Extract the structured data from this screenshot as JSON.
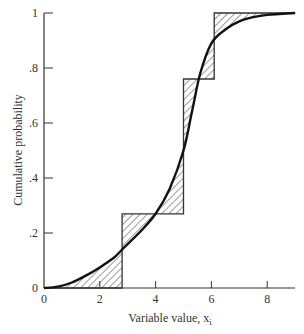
{
  "chart_data": {
    "type": "line",
    "title": "",
    "xlabel": "Variable value, x",
    "xlabel_subscript": "i",
    "ylabel": "Cumulative probability",
    "xlim": [
      0,
      9
    ],
    "ylim": [
      0,
      1
    ],
    "grid": false,
    "x_ticks": [
      0,
      2,
      4,
      6,
      8
    ],
    "x_tick_labels": [
      "0",
      "2",
      "4",
      "6",
      "8"
    ],
    "y_ticks": [
      0,
      0.2,
      0.4,
      0.6,
      0.8,
      1
    ],
    "y_tick_labels": [
      "0",
      ".2",
      ".4",
      ".6",
      ".8",
      "1"
    ],
    "series": [
      {
        "name": "Step (empirical) distribution",
        "style": "step",
        "x": [
          0,
          2.8,
          2.8,
          5.0,
          5.0,
          6.1,
          6.1,
          9.0
        ],
        "y": [
          0,
          0,
          0.27,
          0.27,
          0.76,
          0.76,
          1.0,
          1.0
        ]
      },
      {
        "name": "Smooth cumulative distribution",
        "style": "curve",
        "x": [
          0,
          0.5,
          1.0,
          1.5,
          2.0,
          2.5,
          2.8,
          3.5,
          4.0,
          4.5,
          5.0,
          5.3,
          5.6,
          6.0,
          6.5,
          7.0,
          7.5,
          8.0,
          9.0
        ],
        "y": [
          0,
          0.005,
          0.02,
          0.045,
          0.075,
          0.11,
          0.14,
          0.21,
          0.27,
          0.36,
          0.5,
          0.64,
          0.78,
          0.89,
          0.94,
          0.97,
          0.985,
          0.993,
          1.0
        ]
      }
    ],
    "annotations": [
      "Hatched regions show differences between step function and smooth curve"
    ]
  }
}
